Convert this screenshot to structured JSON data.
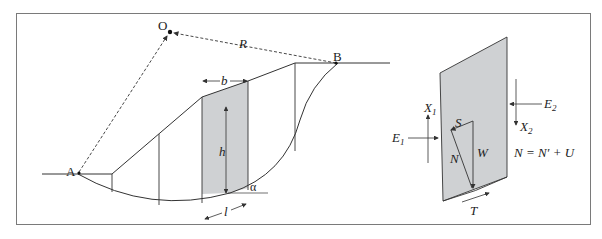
{
  "figure": {
    "left_panel": {
      "title": "Slope with circular slip surface divided into slices",
      "labels": {
        "center": "O",
        "radius": "R",
        "point_a": "A",
        "point_b": "B",
        "width": "b",
        "height": "h",
        "angle": "α",
        "base_length": "l"
      }
    },
    "right_panel": {
      "title": "Forces on a single slice",
      "labels": {
        "x1": "X",
        "x1_sub": "1",
        "x2": "X",
        "x2_sub": "2",
        "e1": "E",
        "e1_sub": "1",
        "e2": "E",
        "e2_sub": "2",
        "s": "S",
        "w": "W",
        "n": "N",
        "t": "T",
        "equation": "N = N′ + U"
      }
    },
    "colors": {
      "stroke": "#333333",
      "shade": "#cfd1d3",
      "frame": "#7a7a7a"
    }
  }
}
